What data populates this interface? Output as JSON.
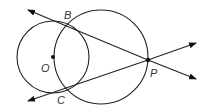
{
  "diagram": {
    "title": "",
    "colors": {
      "stroke": "#222222",
      "label": "#333333",
      "background": "#ffffff"
    },
    "points": {
      "B": {
        "label": "B",
        "x": 68,
        "y": 23
      },
      "C": {
        "label": "C",
        "x": 62,
        "y": 90
      },
      "O": {
        "label": "O",
        "x": 53,
        "y": 57
      },
      "P": {
        "label": "P",
        "x": 148,
        "y": 60
      }
    },
    "circles": [
      {
        "name": "circle-O",
        "cx": 53,
        "cy": 57,
        "r": 36
      },
      {
        "name": "circle-BCP",
        "cx": 101,
        "cy": 57,
        "r": 47
      }
    ],
    "lines": [
      {
        "name": "line-PB",
        "from": [
          196,
          78
        ],
        "to": [
          28,
          8
        ]
      },
      {
        "name": "line-PC",
        "from": [
          196,
          43
        ],
        "to": [
          28,
          102
        ]
      }
    ],
    "labels": {
      "B": "B",
      "C": "C",
      "O": "O",
      "P": "P"
    }
  }
}
